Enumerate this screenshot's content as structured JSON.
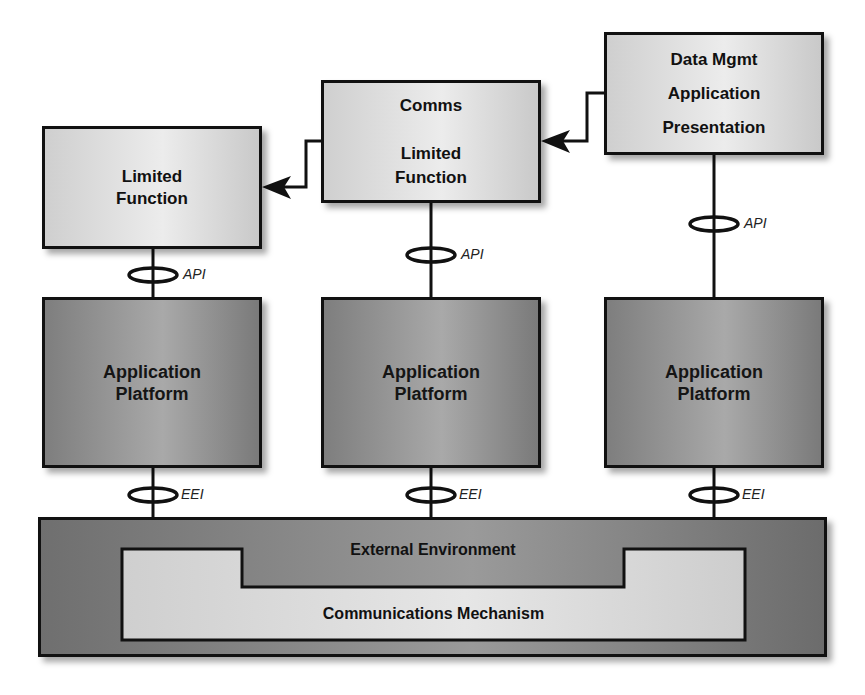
{
  "diagram": {
    "top_boxes": [
      {
        "id": "limited-function",
        "lines": [
          "Limited",
          "Function"
        ]
      },
      {
        "id": "comms-limited-function",
        "lines": [
          "Comms",
          "",
          "Limited",
          "Function"
        ]
      },
      {
        "id": "data-mgmt",
        "lines": [
          "Data Mgmt",
          "Application",
          "Presentation"
        ]
      }
    ],
    "platform_boxes": [
      {
        "lines": [
          "Application",
          "Platform"
        ]
      },
      {
        "lines": [
          "Application",
          "Platform"
        ]
      },
      {
        "lines": [
          "Application",
          "Platform"
        ]
      }
    ],
    "interfaces": {
      "api": [
        "API",
        "API",
        "API"
      ],
      "eei": [
        "EEI",
        "EEI",
        "EEI"
      ]
    },
    "external_environment": "External Environment",
    "communications_mechanism": "Communications Mechanism",
    "arrows": [
      {
        "from": "data-mgmt",
        "to": "comms-limited-function"
      },
      {
        "from": "comms-limited-function",
        "to": "limited-function"
      }
    ],
    "colors": {
      "light_box": "#e0e0e0",
      "dark_box": "#909090",
      "outline": "#111111"
    }
  }
}
